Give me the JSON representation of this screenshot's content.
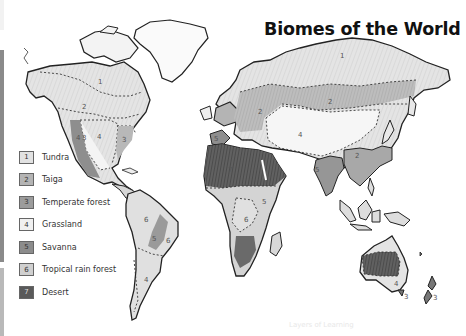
{
  "title": "Biomes of the World",
  "legend": {
    "items": [
      {
        "number": "1",
        "label": "Tundra",
        "color": "#e2e2e2"
      },
      {
        "number": "2",
        "label": "Taiga",
        "color": "#b4b4b4"
      },
      {
        "number": "3",
        "label": "Temperate forest",
        "color": "#9c9c9c"
      },
      {
        "number": "4",
        "label": "Grassland",
        "color": "#f0f0f0"
      },
      {
        "number": "5",
        "label": "Savanna",
        "color": "#8c8c8c"
      },
      {
        "number": "6",
        "label": "Tropical rain forest",
        "color": "#d0d0d0"
      },
      {
        "number": "7",
        "label": "Desert",
        "color": "#5a5a5a"
      }
    ]
  },
  "map_labels": {
    "na_tundra": "1",
    "na_taiga": "2",
    "na_grassland": "4",
    "na_temperate": "3",
    "na_west_4": "4",
    "na_west_3": "3",
    "eu_taiga": "2",
    "eu_savanna": "5",
    "as_tundra": "1",
    "as_taiga": "2",
    "as_grassland": "4",
    "as_se_taiga": "2",
    "in_savanna": "5",
    "af_savanna": "5",
    "af_rainforest": "6",
    "af_desert": "7",
    "sa_rainforest": "6",
    "sa_savanna": "5",
    "sa_rainforest_e": "6",
    "sa_grassland": "4",
    "au_desert": "7",
    "au_grassland": "4",
    "tas_temperate": "3",
    "nz_temperate": "3"
  },
  "watermark": "Layers of Learning"
}
